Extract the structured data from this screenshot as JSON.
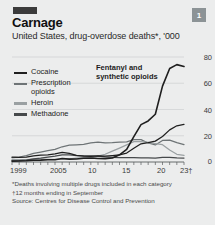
{
  "header": {
    "kicker": "",
    "title": "Carnage",
    "subtitle": "United States, drug-overdose deaths*, '000",
    "badge": "1"
  },
  "annotation": {
    "line1": "Fentanyl and",
    "line2": "synthetic opioids"
  },
  "legend": [
    {
      "label": "Cocaine",
      "color": "#1f1f1f"
    },
    {
      "label": "Prescription opioids",
      "color": "#6e7476"
    },
    {
      "label": "Heroin",
      "color": "#9aa0a2"
    },
    {
      "label": "Methadone",
      "color": "#46494b"
    }
  ],
  "notes": [
    "*Deaths involving multiple drugs included in each category",
    "†12 months ending in September",
    "Source: Centres for Disease Control and Prevention"
  ],
  "colors": {
    "background": "#eceded",
    "gridline": "#c9cbcc",
    "axis": "#5a5d5e",
    "fentanyl": "#1f1f1f",
    "badge": "#8c9396"
  },
  "chart_data": {
    "type": "line",
    "title": "Carnage",
    "subtitle": "United States, drug-overdose deaths*, '000",
    "xlabel": "",
    "ylabel": "'000",
    "xlim": [
      1999,
      2023
    ],
    "ylim": [
      0,
      80
    ],
    "yticks": [
      0,
      20,
      40,
      60,
      80
    ],
    "xticks": [
      1999,
      2005,
      2010,
      2015,
      2020,
      2023
    ],
    "xticklabels": [
      "1999",
      "2005",
      "10",
      "15",
      "20",
      "23†"
    ],
    "grid": true,
    "legend_position": "inside-left",
    "annotations": [
      {
        "text": "Fentanyl and synthetic opioids",
        "x": 2014,
        "y": 66
      }
    ],
    "x": [
      1999,
      2000,
      2001,
      2002,
      2003,
      2004,
      2005,
      2006,
      2007,
      2008,
      2009,
      2010,
      2011,
      2012,
      2013,
      2014,
      2015,
      2016,
      2017,
      2018,
      2019,
      2020,
      2021,
      2022,
      2023
    ],
    "series": [
      {
        "name": "Fentanyl and synthetic opioids",
        "color": "#1f1f1f",
        "values": [
          0.7,
          0.8,
          0.9,
          1.3,
          1.4,
          1.7,
          1.7,
          2.7,
          2.2,
          2.3,
          2.9,
          3.0,
          2.7,
          2.6,
          3.1,
          5.5,
          9.6,
          19.4,
          28.5,
          31.3,
          36.4,
          57.8,
          71.2,
          74.2,
          72.8
        ]
      },
      {
        "name": "Cocaine",
        "color": "#1f1f1f",
        "values": [
          3.8,
          3.5,
          3.8,
          4.6,
          5.2,
          5.4,
          6.2,
          7.4,
          6.5,
          5.1,
          4.4,
          4.2,
          4.7,
          4.4,
          4.9,
          5.4,
          6.8,
          10.4,
          13.9,
          14.7,
          15.9,
          19.4,
          24.5,
          27.6,
          28.6
        ]
      },
      {
        "name": "Prescription opioids",
        "color": "#6e7476",
        "values": [
          3.4,
          3.8,
          4.8,
          6.5,
          7.5,
          8.6,
          9.6,
          11.6,
          12.8,
          13.1,
          13.5,
          14.6,
          15.1,
          14.6,
          14.7,
          15.2,
          15.4,
          17.1,
          17.0,
          14.5,
          13.0,
          16.4,
          16.7,
          14.7,
          13.2
        ]
      },
      {
        "name": "Heroin",
        "color": "#9aa0a2",
        "values": [
          2.0,
          1.8,
          1.8,
          2.1,
          2.1,
          2.0,
          2.0,
          2.1,
          2.4,
          3.0,
          3.3,
          3.0,
          4.4,
          5.9,
          8.3,
          10.6,
          13.0,
          15.5,
          15.5,
          14.9,
          14.0,
          13.2,
          9.2,
          5.9,
          5.1
        ]
      },
      {
        "name": "Methadone",
        "color": "#46494b"
      }
    ],
    "methadone_values": [
      0.8,
      1.0,
      1.5,
      2.4,
      2.9,
      3.8,
      4.5,
      5.4,
      5.5,
      4.9,
      4.7,
      4.6,
      4.4,
      3.9,
      3.6,
      3.4,
      3.3,
      3.3,
      3.2,
      3.1,
      3.0,
      3.5,
      3.6,
      3.2,
      3.0
    ]
  }
}
